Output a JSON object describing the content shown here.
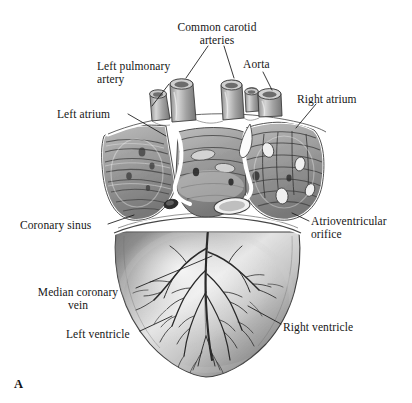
{
  "figure": {
    "letter": "A",
    "background_color": "#ffffff",
    "ink_color": "#161616",
    "labels": [
      {
        "id": "common-carotid-arteries",
        "text": "Common carotid\narteries",
        "align": "center",
        "x": 217,
        "y": 21
      },
      {
        "id": "left-pulmonary-artery",
        "text": "Left pulmonary\nartery",
        "align": "left",
        "x": 97,
        "y": 60
      },
      {
        "id": "aorta",
        "text": "Aorta",
        "align": "left",
        "x": 243,
        "y": 58
      },
      {
        "id": "left-atrium",
        "text": "Left atrium",
        "align": "left",
        "x": 57,
        "y": 108
      },
      {
        "id": "right-atrium",
        "text": "Right atrium",
        "align": "left",
        "x": 297,
        "y": 93
      },
      {
        "id": "coronary-sinus",
        "text": "Coronary sinus",
        "align": "left",
        "x": 20,
        "y": 219
      },
      {
        "id": "atrioventricular-orifice",
        "text": "Atrioventricular\norifice",
        "align": "left",
        "x": 311,
        "y": 215
      },
      {
        "id": "median-coronary-vein",
        "text": "Median coronary\nvein",
        "align": "center",
        "x": 73,
        "y": 286
      },
      {
        "id": "left-ventricle",
        "text": "Left ventricle",
        "align": "left",
        "x": 66,
        "y": 328
      },
      {
        "id": "right-ventricle",
        "text": "Right ventricle",
        "align": "left",
        "x": 283,
        "y": 321
      }
    ],
    "structures": [
      "common carotid arteries",
      "left pulmonary artery",
      "aorta",
      "left atrium",
      "right atrium",
      "coronary sinus",
      "atrioventricular orifice",
      "median coronary vein",
      "left ventricle",
      "right ventricle"
    ]
  }
}
